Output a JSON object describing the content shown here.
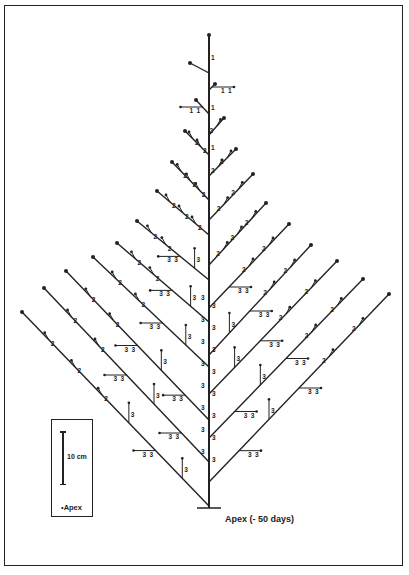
{
  "figure": {
    "type": "tree-architecture-diagram",
    "legend": {
      "scale_label": "10 cm",
      "apex_label": "•Apex"
    },
    "base_label": "Apex (- 50 days)",
    "stroke_color": "#222222"
  },
  "trunk": {
    "x": 209,
    "top": 35,
    "bottom": 508,
    "base_bar": [
      197,
      221
    ]
  },
  "left_branches": [
    {
      "join": [
        209,
        73
      ],
      "tip": [
        190,
        63
      ],
      "labels": []
    },
    {
      "join": [
        209,
        114
      ],
      "tip": [
        196,
        100
      ],
      "labels": [
        "1"
      ]
    },
    {
      "join": [
        209,
        155
      ],
      "tip": [
        185,
        131
      ],
      "labels": [
        "2",
        "2"
      ]
    },
    {
      "join": [
        209,
        200
      ],
      "tip": [
        172,
        162
      ],
      "labels": [
        "2",
        "2",
        "2"
      ]
    },
    {
      "join": [
        209,
        235
      ],
      "tip": [
        157,
        191
      ],
      "labels": [
        "2",
        "2",
        "2"
      ]
    },
    {
      "join": [
        209,
        280
      ],
      "tip": [
        137,
        221
      ],
      "labels": [
        "2",
        "2",
        "3",
        "3"
      ]
    },
    {
      "join": [
        209,
        322
      ],
      "tip": [
        117,
        243
      ],
      "labels": [
        "2",
        "2",
        "3",
        "3"
      ]
    },
    {
      "join": [
        209,
        367
      ],
      "tip": [
        93,
        257
      ],
      "labels": [
        "2",
        "2",
        "3",
        "3"
      ]
    },
    {
      "join": [
        209,
        420
      ],
      "tip": [
        66,
        271
      ],
      "labels": [
        "2",
        "2",
        "3",
        "3",
        "3"
      ]
    },
    {
      "join": [
        209,
        462
      ],
      "tip": [
        44,
        288
      ],
      "labels": [
        "2",
        "2",
        "3",
        "3",
        "3"
      ]
    },
    {
      "join": [
        209,
        506
      ],
      "tip": [
        22,
        312
      ],
      "labels": [
        "2",
        "2",
        "2",
        "3",
        "3",
        "3"
      ]
    }
  ],
  "right_branches": [
    {
      "join": [
        209,
        90
      ],
      "tip": [
        215,
        84
      ],
      "labels": [
        "1"
      ]
    },
    {
      "join": [
        209,
        135
      ],
      "tip": [
        224,
        118
      ],
      "labels": [
        "2"
      ]
    },
    {
      "join": [
        209,
        176
      ],
      "tip": [
        236,
        149
      ],
      "labels": [
        "2",
        "2"
      ]
    },
    {
      "join": [
        209,
        220
      ],
      "tip": [
        253,
        174
      ],
      "labels": [
        "2",
        "2"
      ]
    },
    {
      "join": [
        209,
        265
      ],
      "tip": [
        266,
        203
      ],
      "labels": [
        "2",
        "2",
        "2"
      ]
    },
    {
      "join": [
        209,
        308
      ],
      "tip": [
        289,
        224
      ],
      "labels": [
        "2",
        "2",
        "3"
      ]
    },
    {
      "join": [
        209,
        355
      ],
      "tip": [
        311,
        245
      ],
      "labels": [
        "2",
        "2",
        "3",
        "3"
      ]
    },
    {
      "join": [
        209,
        394
      ],
      "tip": [
        337,
        261
      ],
      "labels": [
        "2",
        "2",
        "3",
        "3"
      ]
    },
    {
      "join": [
        209,
        438
      ],
      "tip": [
        363,
        279
      ],
      "labels": [
        "2",
        "2",
        "3",
        "3",
        "3"
      ]
    },
    {
      "join": [
        209,
        482
      ],
      "tip": [
        389,
        294
      ],
      "labels": [
        "2",
        "2",
        "3",
        "3",
        "3"
      ]
    }
  ]
}
